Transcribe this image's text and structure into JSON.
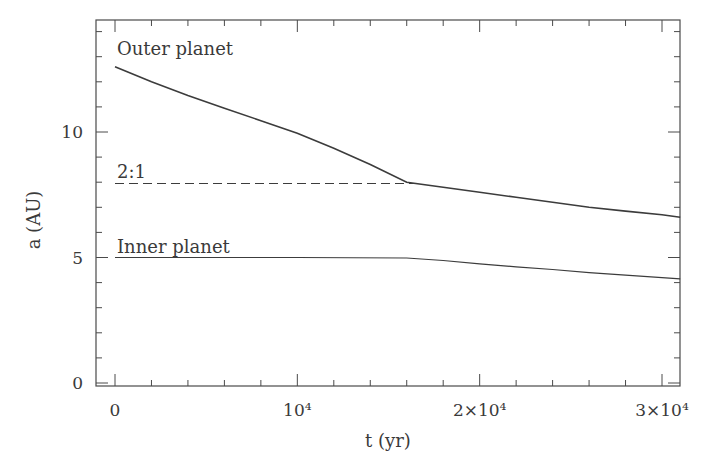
{
  "chart_data": {
    "type": "line",
    "title": "",
    "xlabel": "t (yr)",
    "ylabel": "a (AU)",
    "xlim": [
      -1000,
      31000
    ],
    "ylim": [
      -0.2,
      14.5
    ],
    "x_ticks": [
      {
        "value": 0,
        "label": "0"
      },
      {
        "value": 10000,
        "label": "10⁴"
      },
      {
        "value": 20000,
        "label": "2×10⁴"
      },
      {
        "value": 30000,
        "label": "3×10⁴"
      }
    ],
    "y_ticks": [
      {
        "value": 0,
        "label": "0"
      },
      {
        "value": 5,
        "label": "5"
      },
      {
        "value": 10,
        "label": "10"
      }
    ],
    "grid": false,
    "legend": "none",
    "series": [
      {
        "name": "Outer planet",
        "style": "solid",
        "x": [
          0,
          2000,
          4000,
          6000,
          8000,
          10000,
          12000,
          14000,
          16000,
          18000,
          20000,
          22000,
          24000,
          26000,
          28000,
          30000,
          31000
        ],
        "values": [
          12.6,
          12.0,
          11.45,
          10.95,
          10.45,
          9.95,
          9.35,
          8.7,
          8.0,
          7.8,
          7.6,
          7.4,
          7.2,
          7.0,
          6.85,
          6.7,
          6.6
        ]
      },
      {
        "name": "2:1",
        "style": "dashed",
        "x": [
          0,
          16500
        ],
        "values": [
          7.95,
          7.95
        ]
      },
      {
        "name": "Inner planet",
        "style": "solid",
        "x": [
          0,
          5000,
          10000,
          16000,
          18000,
          20000,
          22000,
          24000,
          26000,
          28000,
          30000,
          31000
        ],
        "values": [
          5.0,
          5.0,
          5.0,
          4.98,
          4.88,
          4.75,
          4.63,
          4.52,
          4.4,
          4.3,
          4.2,
          4.15
        ]
      }
    ],
    "annotations": [
      {
        "text": "Outer planet",
        "x": 0,
        "y": 13.3
      },
      {
        "text": "2:1",
        "x": 0,
        "y": 8.4
      },
      {
        "text": "Inner planet",
        "x": 0,
        "y": 5.4
      }
    ]
  }
}
